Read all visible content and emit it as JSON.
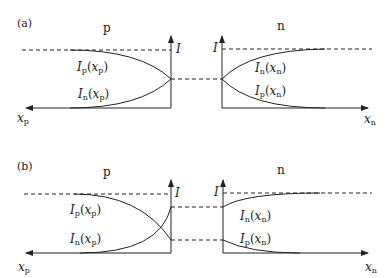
{
  "panels": [
    {
      "id": "a",
      "tag": "(a)",
      "region_left": "p",
      "region_right": "n",
      "axis_label_I": "I",
      "x_left": {
        "base": "x",
        "sub": "p"
      },
      "x_right": {
        "base": "x",
        "sub": "n"
      },
      "curves_left": [
        {
          "base": "I",
          "sub": "p",
          "arg": "x",
          "argsub": "p"
        },
        {
          "base": "I",
          "sub": "n",
          "arg": "x",
          "argsub": "p"
        }
      ],
      "curves_right": [
        {
          "base": "I",
          "sub": "n",
          "arg": "x",
          "argsub": "n"
        },
        {
          "base": "I",
          "sub": "p",
          "arg": "x",
          "argsub": "n"
        }
      ]
    },
    {
      "id": "b",
      "tag": "(b)",
      "region_left": "p",
      "region_right": "n",
      "axis_label_I": "I",
      "x_left": {
        "base": "x",
        "sub": "p"
      },
      "x_right": {
        "base": "x",
        "sub": "n"
      },
      "curves_left": [
        {
          "base": "I",
          "sub": "p",
          "arg": "x",
          "argsub": "p"
        },
        {
          "base": "I",
          "sub": "n",
          "arg": "x",
          "argsub": "p"
        }
      ],
      "curves_right": [
        {
          "base": "I",
          "sub": "n",
          "arg": "x",
          "argsub": "n"
        },
        {
          "base": "I",
          "sub": "p",
          "arg": "x",
          "argsub": "n"
        }
      ]
    }
  ],
  "colors": {
    "line": "#222222",
    "dash": "#333333"
  }
}
